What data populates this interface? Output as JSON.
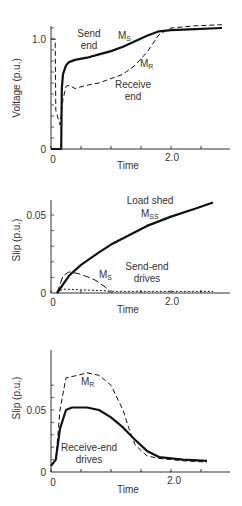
{
  "chart_data": [
    {
      "type": "line",
      "title": "",
      "xlabel": "Time",
      "ylabel": "Voltage (p.u.)",
      "xlim": [
        0,
        2.95
      ],
      "ylim": [
        0,
        1.15
      ],
      "x_ticks": [
        0,
        0.5,
        1.0,
        1.5,
        2.0,
        2.5
      ],
      "x_tick_labels": [
        "0",
        "",
        "",
        "",
        "2.0",
        ""
      ],
      "y_tick_labels": [
        "0",
        "1.0"
      ],
      "grid": false,
      "annotations": [
        "Send end",
        "MS",
        "MR",
        "Receive end"
      ],
      "series": [
        {
          "name": "MS (Send end)",
          "style": "solid",
          "x": [
            0,
            0.17,
            0.18,
            0.2,
            0.25,
            0.3,
            0.4,
            0.6,
            0.8,
            1.0,
            1.2,
            1.4,
            1.6,
            1.8,
            2.0,
            2.4,
            2.85
          ],
          "y": [
            0,
            0,
            0.55,
            0.68,
            0.76,
            0.79,
            0.81,
            0.83,
            0.86,
            0.89,
            0.93,
            0.98,
            1.03,
            1.07,
            1.08,
            1.09,
            1.1
          ]
        },
        {
          "name": "MR (Receive end)",
          "style": "dashed",
          "x": [
            0,
            0.07,
            0.08,
            0.15,
            0.2,
            0.25,
            0.3,
            0.4,
            0.6,
            0.8,
            1.0,
            1.2,
            1.4,
            1.6,
            1.8,
            2.0,
            2.4,
            2.85
          ],
          "y": [
            1.0,
            1.0,
            0.35,
            0.22,
            0.45,
            0.57,
            0.58,
            0.55,
            0.58,
            0.6,
            0.64,
            0.68,
            0.76,
            0.88,
            1.04,
            1.1,
            1.12,
            1.13
          ]
        }
      ]
    },
    {
      "type": "line",
      "title": "",
      "xlabel": "Time",
      "ylabel": "Slip (p.u.)",
      "xlim": [
        0,
        2.95
      ],
      "ylim": [
        0,
        0.062
      ],
      "x_ticks": [
        0,
        0.5,
        1.0,
        1.5,
        2.0,
        2.5
      ],
      "x_tick_labels": [
        "0",
        "",
        "",
        "",
        "2.0",
        ""
      ],
      "y_tick_labels": [
        "0",
        "0.05"
      ],
      "grid": false,
      "annotations": [
        "Load shed",
        "MSS",
        "MS",
        "Send-end drives"
      ],
      "series": [
        {
          "name": "MSS (Load shed)",
          "style": "solid",
          "x": [
            0.1,
            0.3,
            0.5,
            0.8,
            1.0,
            1.3,
            1.6,
            2.0,
            2.4,
            2.7
          ],
          "y": [
            0,
            0.011,
            0.018,
            0.026,
            0.031,
            0.037,
            0.043,
            0.049,
            0.054,
            0.058
          ]
        },
        {
          "name": "MS",
          "style": "long-dashed",
          "x": [
            0.1,
            0.2,
            0.3,
            0.45,
            0.6,
            0.75,
            0.9,
            0.98
          ],
          "y": [
            0,
            0.011,
            0.0135,
            0.0125,
            0.0105,
            0.008,
            0.004,
            0.0005
          ]
        },
        {
          "name": "Send-end drives (other)",
          "style": "short-dashed",
          "x": [
            0.1,
            0.2,
            0.5,
            0.9,
            1.0,
            2.7
          ],
          "y": [
            0,
            0.0025,
            0.002,
            0.0015,
            0.001,
            0.001
          ]
        }
      ]
    },
    {
      "type": "line",
      "title": "",
      "xlabel": "Time",
      "ylabel": "Slip (p.u.)",
      "xlim": [
        0,
        2.95
      ],
      "ylim": [
        0,
        0.09
      ],
      "x_ticks": [
        0,
        0.5,
        1.0,
        1.5,
        2.0,
        2.5
      ],
      "x_tick_labels": [
        "0",
        "",
        "",
        "",
        "2.0",
        ""
      ],
      "y_tick_labels": [
        "0",
        "0.05"
      ],
      "grid": false,
      "annotations": [
        "MR",
        "Receive-end drives"
      ],
      "series": [
        {
          "name": "MR",
          "style": "dashed",
          "x": [
            0,
            0.08,
            0.15,
            0.25,
            0.35,
            0.45,
            0.6,
            0.8,
            1.0,
            1.2,
            1.3,
            1.4,
            1.6,
            1.8,
            2.2,
            2.6
          ],
          "y": [
            0.005,
            0.01,
            0.05,
            0.076,
            0.077,
            0.078,
            0.08,
            0.078,
            0.07,
            0.05,
            0.035,
            0.022,
            0.013,
            0.011,
            0.009,
            0.008
          ]
        },
        {
          "name": "Receive-end drives",
          "style": "solid",
          "x": [
            0,
            0.08,
            0.15,
            0.25,
            0.35,
            0.45,
            0.6,
            0.8,
            1.0,
            1.2,
            1.4,
            1.6,
            1.8,
            2.2,
            2.6
          ],
          "y": [
            0.005,
            0.01,
            0.035,
            0.05,
            0.052,
            0.052,
            0.052,
            0.05,
            0.044,
            0.036,
            0.026,
            0.017,
            0.012,
            0.01,
            0.009
          ]
        }
      ]
    }
  ],
  "labels": {
    "p1_ylabel": "Voltage (p.u.)",
    "p1_ytop": "1.0",
    "p1_y0": "0",
    "p1_x0": "0",
    "p1_x2": "2.0",
    "p1_xlabel": "Time",
    "p1_send": "Send",
    "p1_end": "end",
    "p1_ms": "M",
    "p1_ms_sub": "S",
    "p1_mr": "M",
    "p1_mr_sub": "R",
    "p1_receive": "Receive",
    "p1_receive_end": "end",
    "p2_ylabel": "Slip (p.u.)",
    "p2_ytop": "0.05",
    "p2_y0": "0",
    "p2_x0": "0",
    "p2_x2": "2.0",
    "p2_xlabel": "Time",
    "p2_loadshed": "Load shed",
    "p2_mss": "M",
    "p2_mss_sub": "SS",
    "p2_ms": "M",
    "p2_ms_sub": "S",
    "p2_sendend": "Send-end",
    "p2_drives": "drives",
    "p3_ylabel": "Slip (p.u.)",
    "p3_ytop": "0.05",
    "p3_y0": "0",
    "p3_x0": "0",
    "p3_x2": "2.0",
    "p3_xlabel": "Time",
    "p3_mr": "M",
    "p3_mr_sub": "R",
    "p3_recvend": "Receive-end",
    "p3_drives": "drives"
  }
}
